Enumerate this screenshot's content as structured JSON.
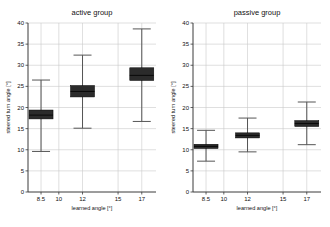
{
  "figure": {
    "width": 330,
    "height": 227,
    "background": "#ffffff",
    "box_color": "#2b2b2b",
    "grid_color": "#c9c9c9",
    "axis_color": "#3a3a3a"
  },
  "chart_data": [
    {
      "type": "box",
      "panel_id": "active",
      "title": "active group",
      "xlabel": "learned angle [°]",
      "ylabel": "steered turn angle [°]",
      "categories": [
        "8.5",
        "10",
        "12",
        "15",
        "17"
      ],
      "x_positions": [
        8.5,
        10,
        12,
        15,
        17
      ],
      "xlim": [
        7.4,
        18.2
      ],
      "ylim": [
        0,
        40
      ],
      "yticks": [
        0,
        5,
        10,
        15,
        20,
        25,
        30,
        35,
        40
      ],
      "grid": true,
      "legend": "none",
      "boxes": [
        {
          "category": "8.5",
          "x": 8.5,
          "whisker_low": 9.6,
          "q1": 17.3,
          "median": 18.2,
          "q3": 19.4,
          "whisker_high": 26.5
        },
        {
          "category": "10",
          "x": 10,
          "empty": true
        },
        {
          "category": "12",
          "x": 12,
          "whisker_low": 15.1,
          "q1": 22.5,
          "median": 23.8,
          "q3": 25.2,
          "whisker_high": 32.4
        },
        {
          "category": "15",
          "x": 15,
          "empty": true
        },
        {
          "category": "17",
          "x": 17,
          "whisker_low": 16.7,
          "q1": 26.4,
          "median": 27.6,
          "q3": 29.4,
          "whisker_high": 38.6
        }
      ]
    },
    {
      "type": "box",
      "panel_id": "passive",
      "title": "passive group",
      "xlabel": "learned angle [°]",
      "ylabel": "steered turn angle [°]",
      "categories": [
        "8.5",
        "10",
        "12",
        "15",
        "17"
      ],
      "x_positions": [
        8.5,
        10,
        12,
        15,
        17
      ],
      "xlim": [
        7.4,
        18.2
      ],
      "ylim": [
        0,
        40
      ],
      "yticks": [
        0,
        5,
        10,
        15,
        20,
        25,
        30,
        35,
        40
      ],
      "grid": true,
      "legend": "none",
      "boxes": [
        {
          "category": "8.5",
          "x": 8.5,
          "whisker_low": 7.3,
          "q1": 10.3,
          "median": 10.8,
          "q3": 11.3,
          "whisker_high": 14.6
        },
        {
          "category": "10",
          "x": 10,
          "empty": true
        },
        {
          "category": "12",
          "x": 12,
          "whisker_low": 9.5,
          "q1": 12.8,
          "median": 13.4,
          "q3": 14.0,
          "whisker_high": 17.5
        },
        {
          "category": "15",
          "x": 15,
          "empty": true
        },
        {
          "category": "17",
          "x": 17,
          "whisker_low": 11.2,
          "q1": 15.5,
          "median": 16.2,
          "q3": 16.9,
          "whisker_high": 21.3
        }
      ]
    }
  ]
}
